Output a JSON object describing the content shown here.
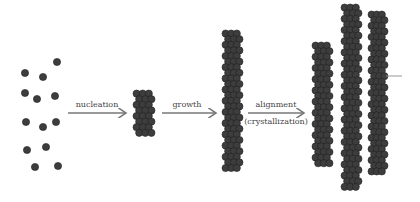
{
  "labels": {
    "nucleation": "nucleation",
    "growth": "growth",
    "alignment": "alignment",
    "crystallization": "(crystallization)"
  },
  "colors": {
    "particle": "#3d3d3d",
    "particle_edge": "#222222",
    "arrow": "#777777"
  },
  "particles": [
    [
      57,
      62
    ],
    [
      25,
      73
    ],
    [
      43,
      77
    ],
    [
      25,
      93
    ],
    [
      37,
      99
    ],
    [
      55,
      96
    ],
    [
      26,
      122
    ],
    [
      43,
      127
    ],
    [
      56,
      122
    ],
    [
      27,
      150
    ],
    [
      46,
      147
    ],
    [
      35,
      167
    ],
    [
      58,
      166
    ]
  ],
  "columns": [
    {
      "x": 133,
      "y": 90,
      "w": 22,
      "h": 50
    },
    {
      "x": 222,
      "y": 30,
      "w": 21,
      "h": 142
    },
    {
      "x": 312,
      "y": 42,
      "w": 21,
      "h": 125
    },
    {
      "x": 341,
      "y": 4,
      "w": 21,
      "h": 188
    },
    {
      "x": 368,
      "y": 11,
      "w": 20,
      "h": 169
    }
  ]
}
